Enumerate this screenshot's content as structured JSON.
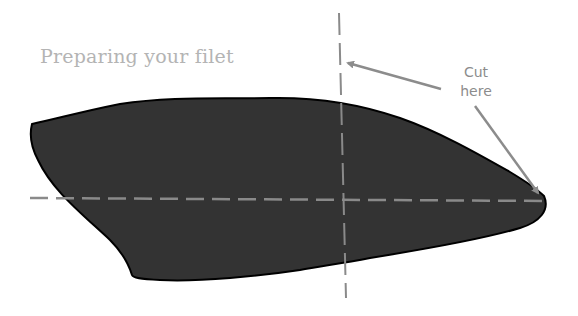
{
  "diagram": {
    "title": "Preparing your filet",
    "annotation": {
      "line1": "Cut",
      "line2": "here"
    },
    "elements": {
      "filet_shape": "dark fish filet silhouette",
      "cut_lines": [
        "vertical dashed cut line",
        "horizontal dashed cut line"
      ],
      "arrows": [
        "arrow to vertical cut line",
        "arrow to horizontal cut line tip"
      ]
    },
    "colors": {
      "filet_fill": "#333333",
      "filet_outline": "#000000",
      "cut_line": "#8a8a8a",
      "arrow": "#8c8c8c",
      "title": "#b4b4b4"
    }
  }
}
